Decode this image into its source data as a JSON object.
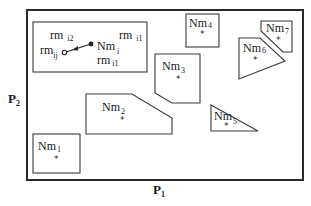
{
  "diagram": {
    "axes": {
      "x_label": "P",
      "x_sub": "1",
      "y_label": "P",
      "y_sub": "2"
    },
    "inset": {
      "labels": [
        {
          "base": "rm",
          "sub": "i2"
        },
        {
          "base": "rm",
          "sub": "i1"
        },
        {
          "base": "rm",
          "sub": "ij"
        },
        {
          "base": "Nm",
          "sub": "i"
        },
        {
          "base": "rm",
          "sub": "i1"
        }
      ],
      "arrow": {
        "from": "Nm_i",
        "to": "rm_ij"
      }
    },
    "regions": [
      {
        "base": "Nm",
        "sub": "1",
        "centroid_symbol": "*"
      },
      {
        "base": "Nm",
        "sub": "2",
        "centroid_symbol": "*"
      },
      {
        "base": "Nm",
        "sub": "3",
        "centroid_symbol": "*"
      },
      {
        "base": "Nm",
        "sub": "4",
        "centroid_symbol": "*"
      },
      {
        "base": "Nm",
        "sub": "5",
        "centroid_symbol": "*"
      },
      {
        "base": "Nm",
        "sub": "6",
        "centroid_symbol": "*"
      },
      {
        "base": "Nm",
        "sub": "7",
        "centroid_symbol": "*"
      }
    ],
    "colors": {
      "stroke": "#3a3a3a",
      "frame": "#2a2a2a",
      "text": "#1a1a1a",
      "background": "#ffffff"
    }
  }
}
